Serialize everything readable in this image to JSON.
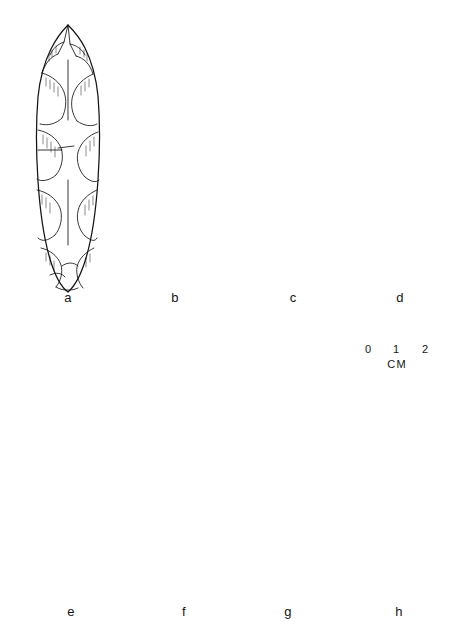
{
  "figure": {
    "kind": "archaeological-artifact-plate",
    "medium": "ink line drawing",
    "background_color": "#ffffff",
    "ink_color": "#141414",
    "rows": 2,
    "columns": 4,
    "total_specimens": 8
  },
  "scale_bar": {
    "name": "centimeter-scale-bar",
    "unit_label": "CM",
    "tick_labels": [
      "0",
      "1",
      "2"
    ],
    "min": 0,
    "max": 2,
    "ticks": 3,
    "position": "between rows, right side"
  },
  "specimens": [
    {
      "id": "a",
      "label": "a",
      "row": 1,
      "column": 1,
      "form": "lanceolate biface",
      "outline": "elongate leaf-shaped, widest at mid-body, rounded base",
      "flaking": "broad irregular collateral flake scars with hatched scar margins",
      "tip": "intact pointed tip",
      "base": "rounded, slightly irregular"
    },
    {
      "id": "b",
      "label": "b",
      "row": 1,
      "column": 2,
      "form": "lanceolate biface",
      "outline": "narrow elongate leaf-shape, tapering to pointed base",
      "flaking": "broad overlapping flake scars, shallow diagonal pattern",
      "tip": "intact pointed tip",
      "base": "narrow pointed"
    },
    {
      "id": "c",
      "label": "c",
      "row": 1,
      "column": 3,
      "form": "lanceolate point with straight stem",
      "outline": "broad blade narrowing to parallel-sided base",
      "flaking": "large irregular percussion scars with fine hatching",
      "tip": "intact pointed tip",
      "base": "straight, slightly concave"
    },
    {
      "id": "d",
      "label": "d",
      "row": 1,
      "column": 4,
      "form": "lanceolate point, parallel-sided",
      "outline": "narrow parallel-sided blade, straight base",
      "flaking": "fine regular transverse-parallel (collateral) flaking",
      "tip": "intact rounded-pointed tip",
      "base": "straight, squared"
    },
    {
      "id": "e",
      "label": "e",
      "row": 2,
      "column": 1,
      "form": "lanceolate biface fragment",
      "outline": "ovate body with missing tip",
      "flaking": "broad irregular flake scars",
      "tip": "broken; missing tip reconstructed with dashed line",
      "base": "rounded",
      "has_reconstruction": true,
      "reconstruction_style": "dashed"
    },
    {
      "id": "f",
      "label": "f",
      "row": 2,
      "column": 2,
      "form": "lanceolate biface",
      "outline": "narrow elongate leaf-shape, symmetrical",
      "flaking": "fine regular collateral flaking with long hatched scars",
      "tip": "intact pointed tip",
      "base": "rounded"
    },
    {
      "id": "g",
      "label": "g",
      "row": 2,
      "column": 3,
      "form": "lanceolate biface",
      "outline": "narrow elongate leaf-shape",
      "flaking": "large longitudinal flake scars with dense parallel hatching",
      "tip": "intact pointed tip",
      "base": "rounded-pointed"
    },
    {
      "id": "h",
      "label": "h",
      "row": 2,
      "column": 4,
      "form": "small lanceolate biface",
      "outline": "small narrow leaf-shape, smallest specimen on plate",
      "flaking": "short irregular flake scars, heavily worked",
      "tip": "intact pointed tip",
      "base": "rounded"
    }
  ]
}
